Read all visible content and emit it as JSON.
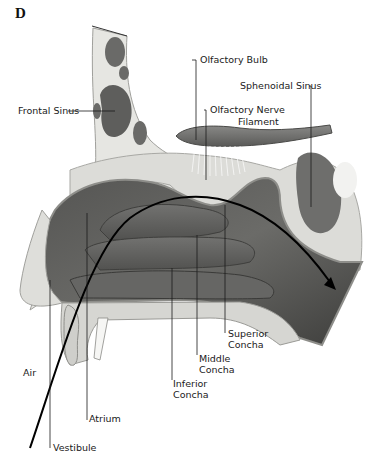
{
  "figure": {
    "panel_label": "D",
    "colors": {
      "background": "#ffffff",
      "bone": "#e4e4e0",
      "bone_outline": "#9a9a96",
      "cavity_dark": "#4a4a48",
      "cavity_mid": "#6e6e6b",
      "concha": "#5c5c5a",
      "mucosa_light": "#c8c8c4",
      "bulb": "#6a6a68",
      "leader_line": "#1a1a1a",
      "air_arrow": "#000000"
    }
  },
  "labels": {
    "frontal_sinus": "Frontal Sinus",
    "olfactory_bulb": "Olfactory Bulb",
    "sphenoidal_sinus": "Sphenoidal Sinus",
    "olfactory_nerve_line1": "Olfactory Nerve",
    "olfactory_nerve_line2": "Filament",
    "superior_concha_line1": "Superior",
    "superior_concha_line2": "Concha",
    "middle_concha_line1": "Middle",
    "middle_concha_line2": "Concha",
    "inferior_concha_line1": "Inferior",
    "inferior_concha_line2": "Concha",
    "air": "Air",
    "atrium": "Atrium",
    "vestibule": "Vestibule"
  }
}
